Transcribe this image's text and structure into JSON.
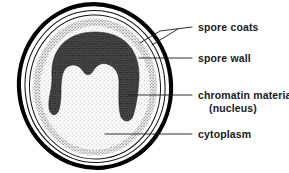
{
  "figure": {
    "type": "labeled-biological-diagram",
    "background_color": "#ffffff",
    "ink_color": "#1a1a1a"
  },
  "structures": [
    {
      "id": "spore-coats",
      "label": "spore coats",
      "description": "outer thick black boundary plus two thin concentric lines",
      "color": "#000000"
    },
    {
      "id": "spore-wall",
      "label": "spore wall",
      "description": "medium-gray stippled ring just inside the coats",
      "color": "#8c8c8c"
    },
    {
      "id": "chromatin-material",
      "label": "chromatin material",
      "sublabel": "(nucleus)",
      "description": "dark inverted-U horseshoe mass across the upper interior",
      "color": "#3a3a3a"
    },
    {
      "id": "cytoplasm",
      "label": "cytoplasm",
      "description": "light finely stippled interior filling the spore",
      "color": "#d9d9d9"
    }
  ],
  "labels": {
    "spore_coats": "spore coats",
    "spore_wall": "spore wall",
    "chromatin_material": "chromatin material",
    "nucleus": "(nucleus)",
    "cytoplasm": "cytoplasm"
  }
}
